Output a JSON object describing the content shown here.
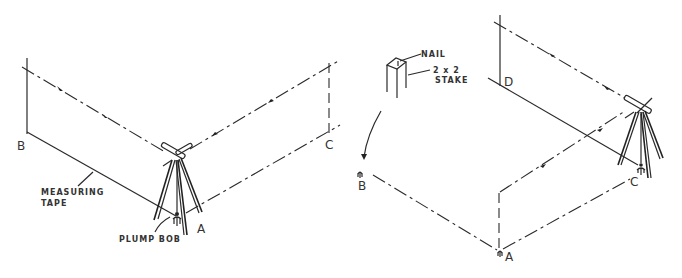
{
  "diagram": {
    "left_figure": {
      "points": {
        "B": "B",
        "C": "C",
        "A": "A"
      },
      "labels": {
        "tape_line1": "MEASURING",
        "tape_line2": "TAPE",
        "plumb": "PLUMP BOB"
      }
    },
    "right_figure": {
      "points": {
        "B": "B",
        "A": "A",
        "C": "C",
        "D": "D"
      },
      "labels": {
        "nail": "NAIL",
        "stake_line1": "2 x 2",
        "stake_line2": "STAKE"
      }
    },
    "colors": {
      "ink": "#2a2a2a",
      "background": "#ffffff"
    }
  }
}
